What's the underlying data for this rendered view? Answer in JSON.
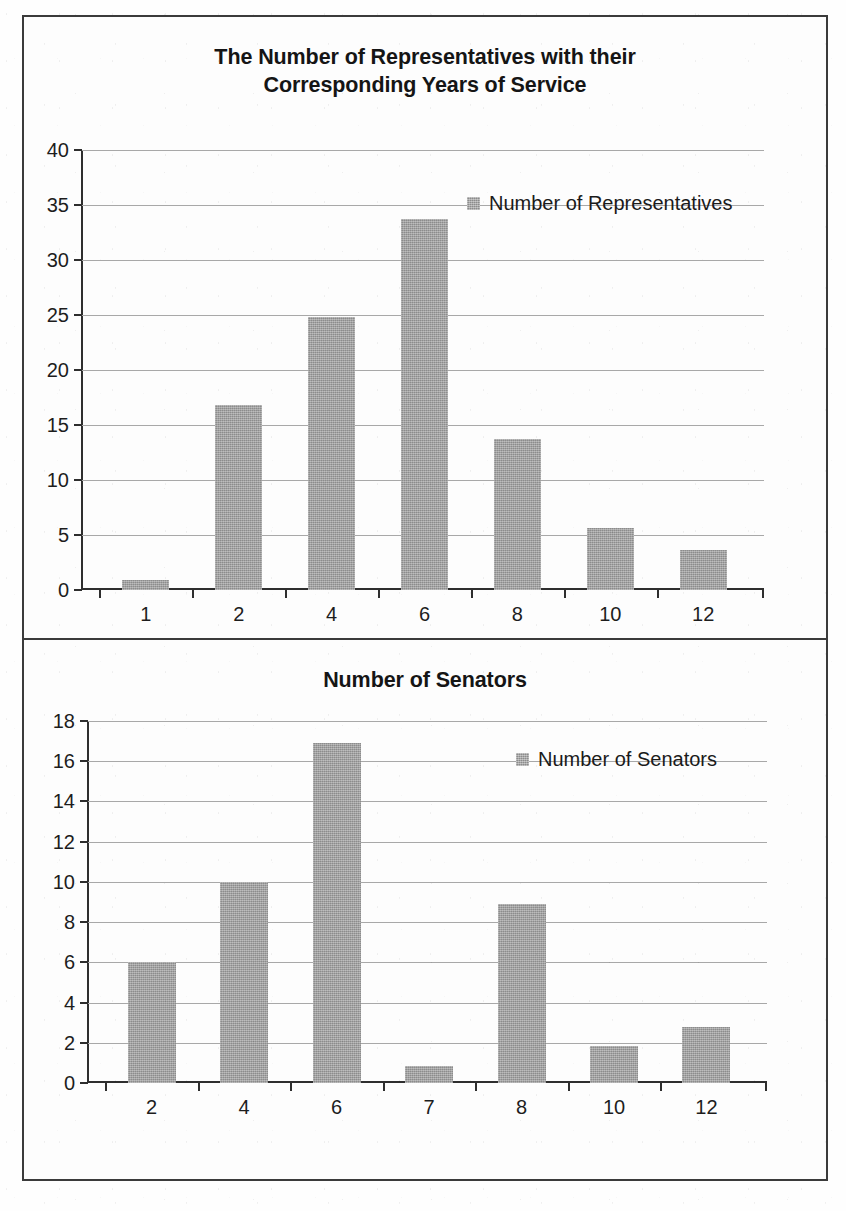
{
  "document": {
    "kind": "scanned-page",
    "frame_color": "#3b3b3b",
    "background_color": "#fdfdfd"
  },
  "bar_color": "#9c9c9c",
  "chart_data": [
    {
      "id": "representatives",
      "type": "bar",
      "title": "The Number of Representatives with their Corresponding Years of Service",
      "xlabel": "",
      "ylabel": "",
      "categories": [
        "1",
        "2",
        "4",
        "6",
        "8",
        "10",
        "12"
      ],
      "values": [
        0.9,
        16.8,
        24.8,
        33.7,
        13.7,
        5.6,
        3.6
      ],
      "ylim": [
        0,
        40
      ],
      "yticks": [
        0,
        5,
        10,
        15,
        20,
        25,
        30,
        35,
        40
      ],
      "ytick_labels": [
        "0",
        "5",
        "10",
        "15",
        "20",
        "25",
        "30",
        "35",
        "40"
      ],
      "grid": true,
      "legend": [
        {
          "label": "Number of Representatives",
          "color": "#9c9c9c"
        }
      ],
      "legend_position": "upper right (inside plot)"
    },
    {
      "id": "senators",
      "type": "bar",
      "title": "Number of Senators",
      "xlabel": "",
      "ylabel": "",
      "categories": [
        "2",
        "4",
        "6",
        "7",
        "8",
        "10",
        "12"
      ],
      "values": [
        6.0,
        10.0,
        16.9,
        0.85,
        8.9,
        1.85,
        2.8
      ],
      "ylim": [
        0,
        18
      ],
      "yticks": [
        0,
        2,
        4,
        6,
        8,
        10,
        12,
        14,
        16,
        18
      ],
      "ytick_labels": [
        "0",
        "2",
        "4",
        "6",
        "8",
        "10",
        "12",
        "14",
        "16",
        "18"
      ],
      "grid": true,
      "legend": [
        {
          "label": "Number of Senators",
          "color": "#9c9c9c"
        }
      ],
      "legend_position": "upper right (inside plot)"
    }
  ]
}
